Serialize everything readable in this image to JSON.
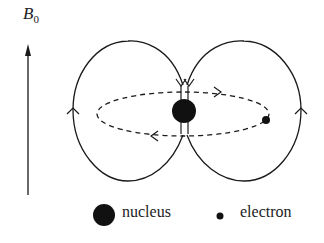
{
  "field_label": {
    "symbol": "B",
    "subscript": "0"
  },
  "legend": [
    {
      "icon": "large-filled-circle",
      "label": "nucleus"
    },
    {
      "icon": "small-filled-circle",
      "label": "electron"
    }
  ],
  "colors": {
    "ink": "#1a1a1a",
    "background": "#ffffff"
  }
}
